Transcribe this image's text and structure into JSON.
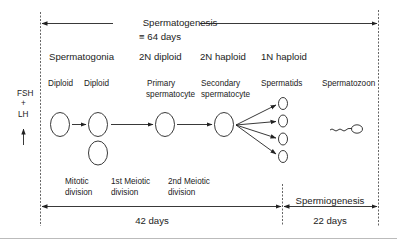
{
  "title": {
    "main": "Spermatogenesis",
    "duration": "≡ 64 days"
  },
  "stages": [
    {
      "header": "Spermatogonia",
      "label": "Diploid"
    },
    {
      "header": "",
      "label": "Diploid"
    },
    {
      "header": "2N diploid",
      "label": "Primary\nspermatocyte"
    },
    {
      "header": "2N haploid",
      "label": "Secondary\nspermatocyte"
    },
    {
      "header": "1N haploid",
      "label": "Spermatids"
    },
    {
      "header": "",
      "label": "Spermatozoon"
    }
  ],
  "headers": {
    "spermatogonia": "Spermatogonia",
    "diploid2n": "2N diploid",
    "haploid2n": "2N haploid",
    "haploid1n": "1N haploid"
  },
  "labels": {
    "diploid_a": "Diploid",
    "diploid_b": "Diploid",
    "primary_1": "Primary",
    "primary_2": "spermatocyte",
    "secondary_1": "Secondary",
    "secondary_2": "spermatocyte",
    "spermatids": "Spermatids",
    "spermatozoon": "Spermatozoon"
  },
  "hormones": {
    "fsh": "FSH",
    "plus": "+",
    "lh": "LH"
  },
  "divisions": {
    "mitotic_1": "Mitotic",
    "mitotic_2": "division",
    "meiotic1_1": "1st Meiotic",
    "meiotic1_2": "division",
    "meiotic2_1": "2nd Meiotic",
    "meiotic2_2": "division"
  },
  "phases": {
    "spermiogenesis": "Spermiogenesis",
    "days_42": "42 days",
    "days_22": "22 days"
  },
  "colors": {
    "stroke": "#222222",
    "text": "#222222",
    "dashed": "#555555",
    "rule": "#bbbbbb"
  }
}
